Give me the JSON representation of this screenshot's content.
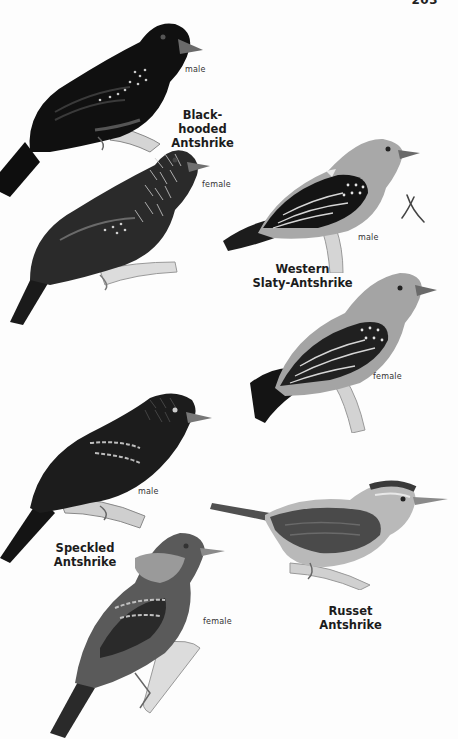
{
  "page": {
    "number": "203"
  },
  "species": [
    {
      "id": "black-hooded",
      "name_line1": "Black-hooded",
      "name_line2": "Antshrike",
      "plates": [
        {
          "sex": "male"
        },
        {
          "sex": "female"
        }
      ]
    },
    {
      "id": "western-slaty",
      "name_line1": "Western",
      "name_line2": "Slaty-Antshrike",
      "plates": [
        {
          "sex": "male"
        },
        {
          "sex": "female"
        }
      ]
    },
    {
      "id": "speckled",
      "name_line1": "Speckled",
      "name_line2": "Antshrike",
      "plates": [
        {
          "sex": "male"
        },
        {
          "sex": "female"
        }
      ]
    },
    {
      "id": "russet",
      "name_line1": "Russet",
      "name_line2": "Antshrike",
      "plates": []
    }
  ],
  "annotations": {
    "handwritten_mark": "X"
  },
  "colors": {
    "ink_black": "#0d0d0d",
    "dark_gray": "#3a3a3a",
    "mid_gray": "#8a8a8a",
    "light_gray": "#c9c9c9",
    "branch": "#d8d8d8"
  }
}
